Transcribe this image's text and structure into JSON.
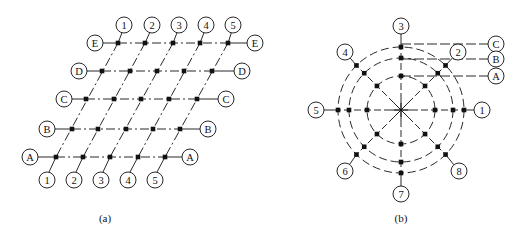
{
  "figure_a": {
    "caption": "(a)",
    "rows": [
      {
        "label": "E",
        "y": 43,
        "left_label_x": 95,
        "right_label_x": 255,
        "nodes_x": [
          118,
          145,
          173,
          200,
          228
        ]
      },
      {
        "label": "D",
        "y": 71,
        "left_label_x": 79,
        "right_label_x": 242,
        "nodes_x": [
          102,
          130,
          157,
          184,
          212
        ]
      },
      {
        "label": "C",
        "y": 99,
        "left_label_x": 64,
        "right_label_x": 226,
        "nodes_x": [
          86,
          114,
          141,
          169,
          197
        ]
      },
      {
        "label": "B",
        "y": 129,
        "left_label_x": 47,
        "right_label_x": 208,
        "nodes_x": [
          72,
          98,
          126,
          153,
          180
        ]
      },
      {
        "label": "A",
        "y": 157,
        "left_label_x": 30,
        "right_label_x": 190,
        "nodes_x": [
          56,
          83,
          110,
          138,
          165
        ]
      }
    ],
    "columns": [
      {
        "label": "1",
        "top": [
          124,
          25
        ],
        "bottom": [
          47,
          180
        ]
      },
      {
        "label": "2",
        "top": [
          152,
          25
        ],
        "bottom": [
          74,
          180
        ]
      },
      {
        "label": "3",
        "top": [
          179,
          25
        ],
        "bottom": [
          101,
          180
        ]
      },
      {
        "label": "4",
        "top": [
          206,
          25
        ],
        "bottom": [
          128,
          180
        ]
      },
      {
        "label": "5",
        "top": [
          233,
          25
        ],
        "bottom": [
          155,
          180
        ]
      }
    ]
  },
  "figure_b": {
    "caption": "(b)",
    "center": [
      401,
      110
    ],
    "rings": [
      {
        "label": "C",
        "radius": 63,
        "label_pos": [
          496,
          44
        ]
      },
      {
        "label": "B",
        "radius": 52,
        "label_pos": [
          496,
          59
        ]
      },
      {
        "label": "A",
        "radius": 34,
        "label_pos": [
          496,
          76
        ]
      }
    ],
    "axes": [
      {
        "label": "1",
        "angle": 0,
        "label_pos": [
          482,
          110
        ]
      },
      {
        "label": "2",
        "angle": 45,
        "label_pos": [
          458,
          52
        ]
      },
      {
        "label": "3",
        "angle": 90,
        "label_pos": [
          401,
          26
        ]
      },
      {
        "label": "4",
        "angle": 135,
        "label_pos": [
          345,
          52
        ]
      },
      {
        "label": "5",
        "angle": 180,
        "label_pos": [
          316,
          110
        ]
      },
      {
        "label": "6",
        "angle": 225,
        "label_pos": [
          345,
          171
        ]
      },
      {
        "label": "7",
        "angle": 270,
        "label_pos": [
          401,
          194
        ]
      },
      {
        "label": "8",
        "angle": 315,
        "label_pos": [
          459,
          171
        ]
      }
    ]
  },
  "style": {
    "stroke": "#111111",
    "background": "#ffffff",
    "label_radius": 8
  }
}
